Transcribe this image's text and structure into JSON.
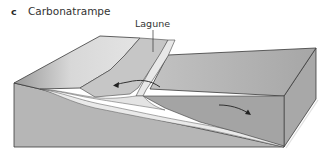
{
  "figure": {
    "panel_label": "c",
    "title": "Carbonatrampe"
  },
  "labels": {
    "lagoon": "Lagune"
  },
  "colors": {
    "front_face": "#b4b4b4",
    "right_face": "#a8a8a8",
    "deep_top": "#a2a2a2",
    "shelf_top": "#c4c4c4",
    "beach": "#e6e6e6",
    "sand_layer": "#e8e8e8",
    "outline": "#3a3a3a"
  },
  "icons": {
    "lagoon_flow_arrow": "arrow-left-curved",
    "offshore_flow_arrow": "arrow-right-curved"
  }
}
